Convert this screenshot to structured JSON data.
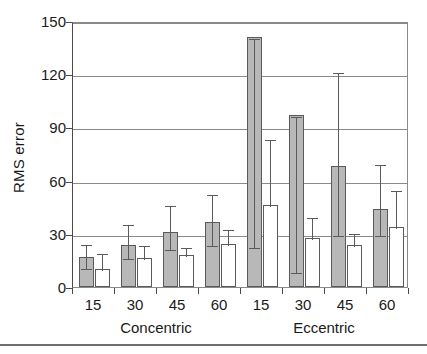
{
  "chart_data": {
    "type": "bar",
    "title": "",
    "xlabel": "",
    "ylabel": "RMS error",
    "ylim": [
      0,
      150
    ],
    "yticks": [
      0,
      30,
      60,
      90,
      120,
      150
    ],
    "grid": true,
    "legend": "none",
    "group_labels": [
      "Concentric",
      "Eccentric"
    ],
    "categories": [
      "15",
      "30",
      "45",
      "60",
      "15",
      "30",
      "45",
      "60"
    ],
    "series": [
      {
        "name": "gray",
        "color": "#b8b8b8",
        "values": [
          17,
          23.5,
          31,
          36.5,
          141,
          97,
          68,
          44
        ],
        "err_low": [
          11,
          17,
          22,
          24,
          23,
          9,
          30,
          30
        ],
        "err_high": [
          25,
          36,
          47,
          53,
          141,
          97,
          122,
          70
        ]
      },
      {
        "name": "white",
        "color": "#ffffff",
        "values": [
          10,
          16.5,
          18,
          24.5,
          46,
          27.5,
          23.5,
          34
        ],
        "err_low": [
          10,
          16.5,
          18,
          24.5,
          46,
          27.5,
          23.5,
          34
        ],
        "err_high": [
          20,
          24,
          23,
          33,
          84,
          40,
          31,
          55
        ]
      }
    ]
  },
  "axis": {
    "y_title": "RMS error",
    "y_tick_labels": [
      "150",
      "120",
      "90",
      "60",
      "30",
      "0"
    ],
    "x_tick_labels": [
      "15",
      "30",
      "45",
      "60",
      "15",
      "30",
      "45",
      "60"
    ],
    "x_group_labels": [
      "Concentric",
      "Eccentric"
    ]
  }
}
